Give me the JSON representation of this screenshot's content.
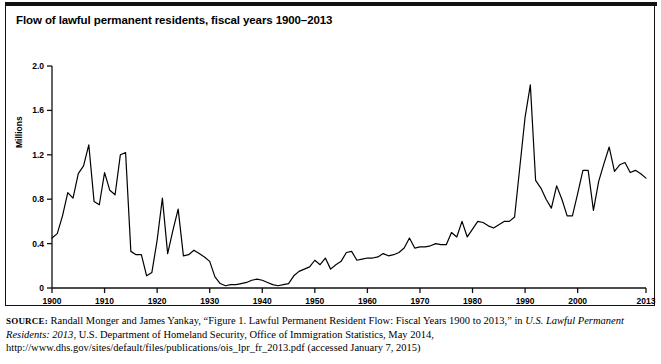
{
  "figure": {
    "title": "Flow of lawful permanent residents, fiscal years 1900–2013",
    "source_prefix": "SOURCE:",
    "source_part1": " Randall Monger and James Yankay, “Figure 1. Lawful Permanent Resident Flow: Fiscal Years 1900 to 2013,” in ",
    "source_italic1": "U.S. Lawful Permanent Residents: 2013",
    "source_part2": ", U.S. Department of Homeland Security, Office of Immigration Statistics, May 2014, http://www.dhs.gov/sites/default/files/publications/ois_lpr_fr_2013.pdf (accessed January 7, 2015)"
  },
  "chart_data": {
    "type": "line",
    "title": "Flow of lawful permanent residents, fiscal years 1900–2013",
    "xlabel": "",
    "ylabel": "Millions",
    "xlim": [
      1900,
      2013
    ],
    "ylim": [
      0,
      2.0
    ],
    "grid": false,
    "legend": null,
    "line_color": "#000000",
    "ytick_labels": [
      "0",
      "0.4",
      "0.8",
      "1.2",
      "1.6",
      "2.0"
    ],
    "ytick_values": [
      0,
      0.4,
      0.8,
      1.2,
      1.6,
      2.0
    ],
    "xtick_labels": [
      "1900",
      "1910",
      "1920",
      "1930",
      "1940",
      "1950",
      "1960",
      "1970",
      "1980",
      "1990",
      "2000",
      "2013"
    ],
    "xtick_values": [
      1900,
      1910,
      1920,
      1930,
      1940,
      1950,
      1960,
      1970,
      1980,
      1990,
      2000,
      2013
    ],
    "x": [
      1900,
      1901,
      1902,
      1903,
      1904,
      1905,
      1906,
      1907,
      1908,
      1909,
      1910,
      1911,
      1912,
      1913,
      1914,
      1915,
      1916,
      1917,
      1918,
      1919,
      1920,
      1921,
      1922,
      1923,
      1924,
      1925,
      1926,
      1927,
      1928,
      1929,
      1930,
      1931,
      1932,
      1933,
      1934,
      1935,
      1936,
      1937,
      1938,
      1939,
      1940,
      1941,
      1942,
      1943,
      1944,
      1945,
      1946,
      1947,
      1948,
      1949,
      1950,
      1951,
      1952,
      1953,
      1954,
      1955,
      1956,
      1957,
      1958,
      1959,
      1960,
      1961,
      1962,
      1963,
      1964,
      1965,
      1966,
      1967,
      1968,
      1969,
      1970,
      1971,
      1972,
      1973,
      1974,
      1975,
      1976,
      1977,
      1978,
      1979,
      1980,
      1981,
      1982,
      1983,
      1984,
      1985,
      1986,
      1987,
      1988,
      1989,
      1990,
      1991,
      1992,
      1993,
      1994,
      1995,
      1996,
      1997,
      1998,
      1999,
      2000,
      2001,
      2002,
      2003,
      2004,
      2005,
      2006,
      2007,
      2008,
      2009,
      2010,
      2011,
      2012,
      2013
    ],
    "values": [
      0.45,
      0.49,
      0.65,
      0.86,
      0.81,
      1.03,
      1.1,
      1.29,
      0.78,
      0.75,
      1.04,
      0.88,
      0.84,
      1.2,
      1.22,
      0.33,
      0.3,
      0.3,
      0.11,
      0.14,
      0.43,
      0.81,
      0.31,
      0.52,
      0.71,
      0.29,
      0.3,
      0.34,
      0.31,
      0.28,
      0.24,
      0.1,
      0.04,
      0.02,
      0.03,
      0.03,
      0.04,
      0.05,
      0.07,
      0.08,
      0.07,
      0.05,
      0.03,
      0.02,
      0.03,
      0.04,
      0.11,
      0.15,
      0.17,
      0.19,
      0.25,
      0.21,
      0.27,
      0.17,
      0.21,
      0.24,
      0.32,
      0.33,
      0.25,
      0.26,
      0.27,
      0.27,
      0.28,
      0.31,
      0.29,
      0.3,
      0.32,
      0.36,
      0.45,
      0.36,
      0.37,
      0.37,
      0.38,
      0.4,
      0.39,
      0.39,
      0.5,
      0.46,
      0.6,
      0.46,
      0.53,
      0.6,
      0.59,
      0.56,
      0.54,
      0.57,
      0.6,
      0.6,
      0.64,
      1.09,
      1.54,
      1.83,
      0.97,
      0.9,
      0.8,
      0.72,
      0.92,
      0.8,
      0.65,
      0.65,
      0.85,
      1.06,
      1.06,
      0.7,
      0.96,
      1.12,
      1.27,
      1.05,
      1.11,
      1.13,
      1.04,
      1.06,
      1.03,
      0.99
    ],
    "annotations": []
  }
}
